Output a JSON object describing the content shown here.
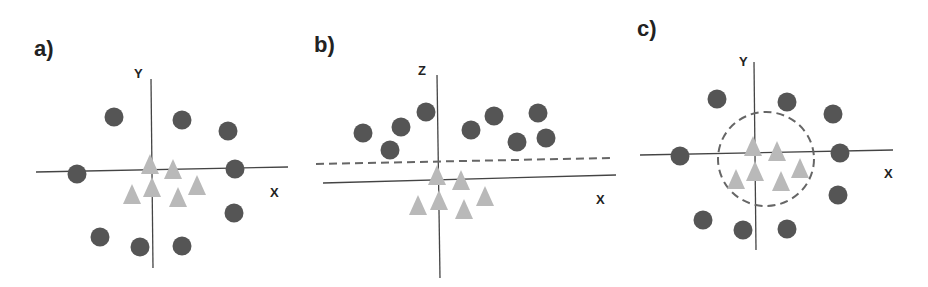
{
  "colors": {
    "circle": "#555555",
    "triangle": "#b9b9b9",
    "axis": "#444444",
    "dashed": "#666666"
  },
  "panels": [
    {
      "label": "a)",
      "axes": {
        "vertical": "Y",
        "horizontal": "X"
      },
      "boundary": "none",
      "circles": [
        [
          114,
          117
        ],
        [
          182,
          120
        ],
        [
          228,
          131
        ],
        [
          77,
          174
        ],
        [
          235,
          169
        ],
        [
          234,
          213
        ],
        [
          100,
          237
        ],
        [
          140,
          247
        ],
        [
          182,
          246
        ]
      ],
      "triangles": [
        [
          150,
          165
        ],
        [
          173,
          170
        ],
        [
          132,
          195
        ],
        [
          152,
          188
        ],
        [
          178,
          198
        ],
        [
          197,
          186
        ]
      ]
    },
    {
      "label": "b)",
      "axes": {
        "vertical": "Z",
        "horizontal": "X"
      },
      "boundary": "dashed line",
      "circles": [
        [
          363,
          133
        ],
        [
          390,
          150
        ],
        [
          401,
          127
        ],
        [
          426,
          112
        ],
        [
          471,
          130
        ],
        [
          494,
          116
        ],
        [
          517,
          142
        ],
        [
          538,
          113
        ],
        [
          546,
          138
        ]
      ],
      "triangles": [
        [
          437,
          176
        ],
        [
          461,
          181
        ],
        [
          418,
          206
        ],
        [
          439,
          201
        ],
        [
          464,
          210
        ],
        [
          485,
          197
        ]
      ]
    },
    {
      "label": "c)",
      "axes": {
        "vertical": "Y",
        "horizontal": "X"
      },
      "boundary": "dashed circle",
      "circles": [
        [
          717,
          99
        ],
        [
          787,
          102
        ],
        [
          833,
          114
        ],
        [
          680,
          156
        ],
        [
          840,
          153
        ],
        [
          838,
          195
        ],
        [
          703,
          220
        ],
        [
          743,
          230
        ],
        [
          787,
          229
        ]
      ],
      "triangles": [
        [
          753,
          147
        ],
        [
          777,
          152
        ],
        [
          736,
          180
        ],
        [
          755,
          172
        ],
        [
          781,
          182
        ],
        [
          800,
          169
        ]
      ]
    }
  ]
}
